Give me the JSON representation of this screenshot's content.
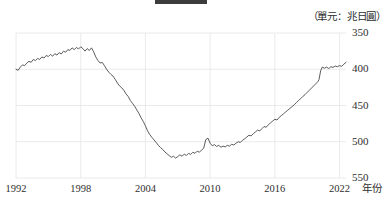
{
  "unit_label": "（單元：兆日圓）",
  "axis": {
    "x_name": "年份",
    "x_ticks": [
      "1992",
      "1998",
      "2004",
      "2010",
      "2016",
      "2022"
    ],
    "y_ticks": [
      "550",
      "500",
      "450",
      "400",
      "350"
    ]
  },
  "colors": {
    "line": "#4a4a4a",
    "grid": "#e4e4e8",
    "text": "#2e2e2e",
    "background": "#ffffff"
  },
  "chart_data": {
    "type": "line",
    "title": "",
    "xlabel": "年份",
    "ylabel": "",
    "unit": "兆日圓",
    "grid": true,
    "legend": "none",
    "xlim": [
      1992,
      2022.6
    ],
    "ylim": [
      350,
      550
    ],
    "x_tick_values": [
      1992,
      1998,
      2004,
      2010,
      2016,
      2022
    ],
    "y_tick_values": [
      350,
      400,
      450,
      500,
      550
    ],
    "series": [
      {
        "name": "餘額",
        "x": [
          1992.0,
          1992.2,
          1992.4,
          1992.6,
          1992.8,
          1993.0,
          1993.2,
          1993.4,
          1993.6,
          1993.8,
          1994.0,
          1994.2,
          1994.4,
          1994.6,
          1994.8,
          1995.0,
          1995.2,
          1995.4,
          1995.6,
          1995.8,
          1996.0,
          1996.2,
          1996.4,
          1996.6,
          1996.8,
          1997.0,
          1997.2,
          1997.4,
          1997.6,
          1997.8,
          1998.0,
          1998.2,
          1998.4,
          1998.6,
          1998.8,
          1999.0,
          1999.2,
          1999.4,
          1999.6,
          1999.8,
          2000.0,
          2000.2,
          2000.4,
          2000.6,
          2000.8,
          2001.0,
          2001.2,
          2001.4,
          2001.6,
          2001.8,
          2002.0,
          2002.2,
          2002.4,
          2002.6,
          2002.8,
          2003.0,
          2003.2,
          2003.4,
          2003.6,
          2003.8,
          2004.0,
          2004.2,
          2004.4,
          2004.6,
          2004.8,
          2005.0,
          2005.2,
          2005.4,
          2005.6,
          2005.8,
          2006.0,
          2006.2,
          2006.4,
          2006.6,
          2006.8,
          2007.0,
          2007.2,
          2007.4,
          2007.6,
          2007.8,
          2008.0,
          2008.2,
          2008.4,
          2008.6,
          2008.8,
          2009.0,
          2009.2,
          2009.4,
          2009.6,
          2009.8,
          2010.0,
          2010.2,
          2010.4,
          2010.6,
          2010.8,
          2011.0,
          2011.2,
          2011.4,
          2011.6,
          2011.8,
          2012.0,
          2012.2,
          2012.4,
          2012.6,
          2012.8,
          2013.0,
          2013.2,
          2013.4,
          2013.6,
          2013.8,
          2014.0,
          2014.2,
          2014.4,
          2014.6,
          2014.8,
          2015.0,
          2015.2,
          2015.4,
          2015.6,
          2015.8,
          2016.0,
          2016.2,
          2016.4,
          2016.6,
          2016.8,
          2017.0,
          2017.2,
          2017.4,
          2017.6,
          2017.8,
          2018.0,
          2018.2,
          2018.4,
          2018.6,
          2018.8,
          2019.0,
          2019.2,
          2019.4,
          2019.6,
          2019.8,
          2020.0,
          2020.1,
          2020.25,
          2020.4,
          2020.6,
          2020.8,
          2021.0,
          2021.2,
          2021.4,
          2021.6,
          2021.8,
          2022.0,
          2022.2,
          2022.4,
          2022.6
        ],
        "y": [
          500.0,
          498.5,
          503.0,
          506.0,
          505.0,
          508.5,
          511.0,
          509.5,
          513.5,
          512.0,
          515.0,
          513.5,
          517.0,
          515.5,
          519.0,
          517.5,
          520.5,
          518.0,
          521.5,
          519.5,
          523.0,
          521.0,
          525.0,
          523.5,
          527.0,
          526.0,
          529.5,
          527.0,
          530.0,
          528.0,
          531.0,
          528.5,
          525.0,
          528.5,
          526.0,
          529.5,
          524.0,
          517.0,
          512.0,
          508.5,
          509.5,
          505.0,
          500.0,
          496.0,
          493.0,
          490.5,
          486.0,
          481.0,
          477.0,
          474.5,
          471.0,
          466.0,
          462.5,
          457.0,
          453.0,
          449.0,
          444.0,
          439.0,
          433.0,
          428.0,
          422.0,
          415.0,
          410.0,
          406.0,
          402.5,
          399.0,
          395.0,
          392.0,
          389.5,
          386.0,
          383.5,
          381.0,
          378.5,
          380.0,
          377.5,
          379.5,
          382.0,
          380.0,
          383.0,
          381.0,
          384.0,
          382.5,
          385.5,
          384.0,
          387.0,
          385.5,
          388.5,
          391.0,
          403.0,
          405.0,
          398.0,
          394.5,
          396.0,
          393.5,
          395.0,
          392.5,
          394.0,
          393.0,
          395.0,
          394.0,
          396.5,
          395.5,
          398.0,
          400.0,
          399.0,
          402.0,
          404.0,
          406.5,
          409.0,
          408.0,
          411.0,
          413.5,
          416.0,
          415.0,
          418.0,
          421.0,
          420.0,
          423.5,
          426.0,
          428.5,
          431.0,
          430.0,
          433.5,
          436.0,
          438.5,
          441.0,
          443.5,
          446.0,
          448.5,
          451.0,
          454.0,
          457.0,
          459.5,
          462.5,
          465.0,
          468.0,
          471.0,
          474.0,
          477.0,
          480.0,
          483.0,
          486.0,
          498.0,
          503.0,
          501.5,
          503.0,
          501.0,
          503.5,
          502.5,
          504.5,
          503.5,
          505.0,
          504.0,
          507.0,
          509.5
        ]
      }
    ]
  }
}
